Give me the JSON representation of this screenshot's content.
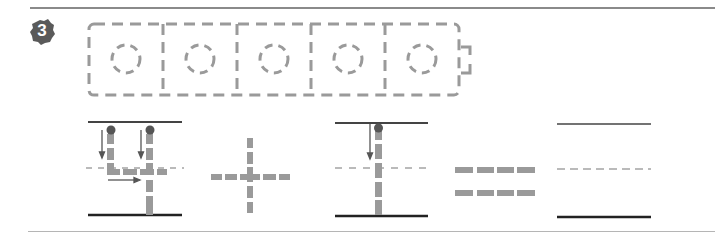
{
  "exercise": {
    "number": "3",
    "badge_color": "#5a5a5a",
    "guide_color": "#9a9a9a",
    "line_color": "#333333",
    "trace_boxes": {
      "count": 5,
      "content": "circle (ㅇ) dashed tracing guide"
    },
    "stroke_order_panels": [
      {
        "name": "glyph-yo",
        "description": "ㅛ vowel stroke order with arrows"
      },
      {
        "name": "glyph-cross",
        "description": "dashed plus/cross shape"
      },
      {
        "name": "glyph-i",
        "description": "ㅣ vertical stroke with arrow"
      },
      {
        "name": "glyph-equals",
        "description": "double dashed horizontal bars"
      },
      {
        "name": "blank-guide",
        "description": "empty writing guide lines"
      }
    ]
  }
}
